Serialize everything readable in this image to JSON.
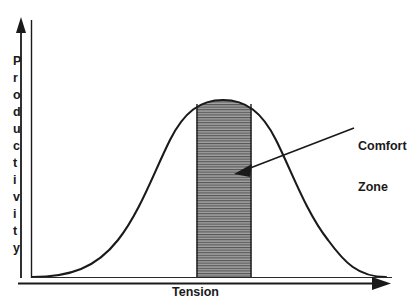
{
  "figure": {
    "title": "",
    "y_axis_label": "Productivity",
    "y_axis_letters": [
      "P",
      "r",
      "o",
      "d",
      "u",
      "c",
      "t",
      "i",
      "v",
      "i",
      "t",
      "y"
    ],
    "x_axis_label": "Tension",
    "annotation_line_1": "Comfort",
    "annotation_line_2": "Zone",
    "colors": {
      "line": "#1a1a1a",
      "axis": "#1a1a1a",
      "shaded_fill": "#9a9a9a",
      "shaded_hatch": "#4d4d4d",
      "background": "#ffffff",
      "text": "#1a1a1a"
    }
  },
  "chart_data": {
    "type": "line",
    "title": "",
    "xlabel": "Tension",
    "ylabel": "Productivity",
    "xlim": [
      0,
      100
    ],
    "ylim": [
      0,
      100
    ],
    "grid": false,
    "legend": "none",
    "axis_ticks": {
      "x": [],
      "y": []
    },
    "series": [
      {
        "name": "Productivity vs Tension",
        "description": "Inverted-U (Yerkes-Dodson) bell curve",
        "x": [
          0,
          5,
          10,
          15,
          20,
          25,
          30,
          35,
          40,
          45,
          50,
          55,
          60,
          65,
          70,
          75,
          80,
          85,
          90,
          95,
          100
        ],
        "y": [
          0,
          2,
          5,
          9,
          15,
          24,
          36,
          51,
          67,
          82,
          94,
          99,
          96,
          86,
          72,
          56,
          41,
          28,
          17,
          8,
          0
        ]
      }
    ],
    "annotations": [
      {
        "label": "Comfort Zone",
        "type": "shaded-region",
        "x_range": [
          47,
          62
        ],
        "fill": "#9a9a9a",
        "hatch": "horizontal-lines",
        "arrow_from": [
          85,
          62
        ],
        "arrow_to": [
          56,
          56
        ]
      }
    ]
  }
}
